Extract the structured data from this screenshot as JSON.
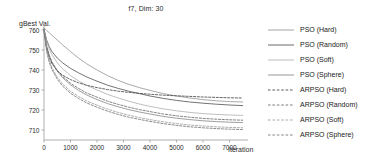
{
  "chart_data": {
    "type": "line",
    "title": "f7, Dim: 30",
    "xlabel": "Iteration",
    "ylabel": "gBest Val.",
    "xlim": [
      0,
      7700
    ],
    "ylim": [
      705,
      762
    ],
    "xticks": [
      0,
      1000,
      2000,
      3000,
      4000,
      5000,
      6000,
      7000
    ],
    "xticklabels": [
      "0",
      "1000",
      "2000",
      "3000",
      "4000",
      "5000",
      "6000",
      "7000"
    ],
    "yticks": [
      710,
      720,
      730,
      740,
      750,
      760
    ],
    "yticklabels": [
      "710",
      "720",
      "730",
      "740",
      "750",
      "760"
    ],
    "grid": false,
    "legend_position": "right",
    "x": [
      0,
      100,
      200,
      300,
      500,
      700,
      1000,
      1300,
      1600,
      2000,
      2400,
      2800,
      3200,
      3600,
      4000,
      4500,
      5000,
      5500,
      6000,
      6500,
      7000,
      7500
    ],
    "series": [
      {
        "name": "PSO (Hard)",
        "style": "solid",
        "color": "#9a9a9a",
        "values": [
          761.0,
          759.8,
          758.6,
          757.4,
          755.0,
          752.6,
          749.2,
          746.0,
          743.2,
          740.0,
          737.2,
          734.8,
          732.8,
          731.2,
          729.8,
          728.2,
          727.0,
          726.0,
          725.2,
          724.6,
          724.2,
          724.0
        ]
      },
      {
        "name": "PSO (Random)",
        "style": "solid",
        "color": "#5a5a5a",
        "values": [
          760.4,
          755.0,
          751.6,
          749.2,
          746.0,
          743.6,
          740.8,
          738.6,
          736.6,
          734.4,
          732.4,
          730.8,
          729.4,
          728.2,
          727.0,
          725.8,
          724.8,
          724.0,
          723.4,
          722.9,
          722.5,
          722.2
        ]
      },
      {
        "name": "PSO (Soft)",
        "style": "solid",
        "color": "#b4b4b4",
        "values": [
          760.2,
          754.2,
          750.4,
          747.6,
          743.6,
          740.6,
          737.2,
          734.6,
          732.4,
          730.0,
          727.8,
          726.0,
          724.4,
          723.0,
          721.8,
          720.6,
          719.6,
          718.8,
          718.2,
          717.8,
          717.5,
          717.3
        ]
      },
      {
        "name": "PSO (Sphere)",
        "style": "solid",
        "color": "#8c8c8c",
        "values": [
          759.8,
          751.6,
          747.0,
          743.8,
          739.4,
          736.2,
          732.6,
          729.8,
          727.6,
          725.2,
          723.2,
          721.6,
          720.2,
          719.0,
          718.0,
          716.8,
          715.9,
          715.2,
          714.6,
          714.2,
          713.9,
          713.7
        ]
      },
      {
        "name": "ARPSO (Hard)",
        "style": "dashed",
        "color": "#4a4a4a",
        "values": [
          759.0,
          750.6,
          746.2,
          743.2,
          739.6,
          737.4,
          735.2,
          733.6,
          732.4,
          731.2,
          730.2,
          729.4,
          728.8,
          728.3,
          727.9,
          727.4,
          727.1,
          726.8,
          726.5,
          726.3,
          726.1,
          726.0
        ]
      },
      {
        "name": "ARPSO (Random)",
        "style": "dashed",
        "color": "#6e6e6e",
        "values": [
          760.6,
          752.2,
          747.4,
          744.0,
          739.8,
          736.8,
          733.4,
          730.8,
          728.6,
          726.4,
          724.4,
          722.8,
          721.4,
          720.2,
          719.2,
          718.0,
          717.1,
          716.4,
          715.8,
          715.4,
          715.1,
          714.9
        ]
      },
      {
        "name": "ARPSO (Soft)",
        "style": "dashed",
        "color": "#a0a0a0",
        "values": [
          760.8,
          750.0,
          744.8,
          741.2,
          736.4,
          733.0,
          729.4,
          726.8,
          724.6,
          722.4,
          720.4,
          718.8,
          717.4,
          716.2,
          715.2,
          714.1,
          713.2,
          712.5,
          712.0,
          711.6,
          711.3,
          711.1
        ]
      },
      {
        "name": "ARPSO (Sphere)",
        "style": "dashed",
        "color": "#787878",
        "values": [
          760.2,
          749.2,
          743.8,
          740.2,
          735.4,
          732.0,
          728.4,
          725.8,
          723.6,
          721.4,
          719.4,
          717.8,
          716.4,
          715.3,
          714.3,
          713.2,
          712.3,
          711.6,
          711.1,
          710.7,
          710.4,
          710.2
        ]
      }
    ]
  },
  "legend": {
    "items": [
      {
        "label": "PSO (Hard)"
      },
      {
        "label": "PSO (Random)"
      },
      {
        "label": "PSO (Soft)"
      },
      {
        "label": "PSO (Sphere)"
      },
      {
        "label": "ARPSO (Hard)"
      },
      {
        "label": "ARPSO (Random)"
      },
      {
        "label": "ARPSO (Soft)"
      },
      {
        "label": "ARPSO (Sphere)"
      }
    ]
  }
}
